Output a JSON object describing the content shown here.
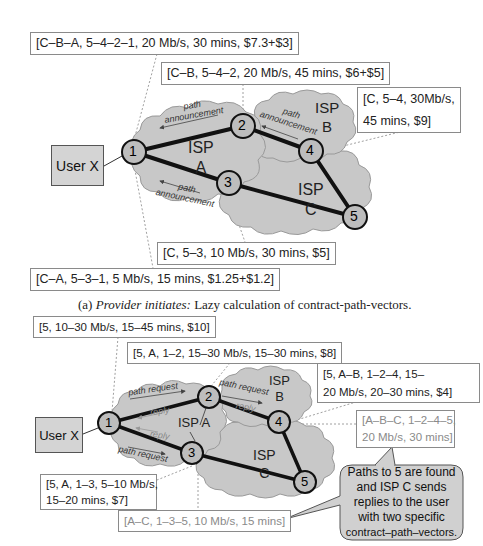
{
  "top": {
    "labels": {
      "cba": "[C–B–A, 5–4–2–1, 20 Mb/s, 30 mins, $7.3+$3]",
      "cb": "[C–B, 5–4–2, 20 Mb/s, 45 mins, $6+$5]",
      "c54_line1": "[C, 5–4, 30Mb/s,",
      "c54_line2": "45 mins, $9]",
      "c53": "[C, 5–3, 10 Mb/s, 30 mins, $5]",
      "ca": "[C–A, 5–3–1, 5 Mb/s, 15 mins, $1.25+$1.2]"
    },
    "user": "User X",
    "isps": {
      "a": [
        "ISP",
        "A"
      ],
      "b": [
        "ISP",
        "B"
      ],
      "c": [
        "ISP",
        "C"
      ]
    },
    "nodes": [
      "1",
      "2",
      "3",
      "4",
      "5"
    ],
    "arrows": {
      "path_announcement": "path announcement"
    },
    "caption_prefix": "(a) ",
    "caption_italic": "Provider initiates:",
    "caption_rest": " Lazy calculation of contract-path-vectors."
  },
  "bottom": {
    "labels": {
      "b5": "[5, 10–30 Mb/s, 15–45 mins, $10]",
      "b5a12": "[5, A, 1–2, 15–30 Mb/s, 15–30 mins, $8]",
      "b5ab_line1": "[5, A–B, 1–2–4, 15–",
      "b5ab_line2": "20 Mb/s, 20–30 mins, $4]",
      "abc_line1": "[A–B–C, 1–2–4–5,",
      "abc_line2": "20 Mb/s, 30 mins]",
      "b5a13_line1": "[5, A, 1–3, 5–10 Mb/s,",
      "b5a13_line2": "15–20 mins, $7]",
      "ac": "[A–C, 1–3–5, 10 Mb/s, 15 mins]"
    },
    "user": "User X",
    "isps": {
      "a": "ISP A",
      "b": [
        "ISP",
        "B"
      ],
      "c": [
        "ISP",
        "C"
      ]
    },
    "nodes": [
      "1",
      "2",
      "3",
      "4",
      "5"
    ],
    "arrows": {
      "path_request": "path request",
      "reply": "reply"
    },
    "callout": [
      "Paths to 5 are found",
      "and ISP C sends",
      "replies to the user",
      "with two specific",
      "contract–path–vectors."
    ]
  },
  "colors": {
    "cloud": "#c8c8c8",
    "cloud_stroke": "#9a9a9a",
    "node_fill": "#bdbdbd",
    "link": "#111111",
    "grey_text": "#8a8a8a"
  }
}
